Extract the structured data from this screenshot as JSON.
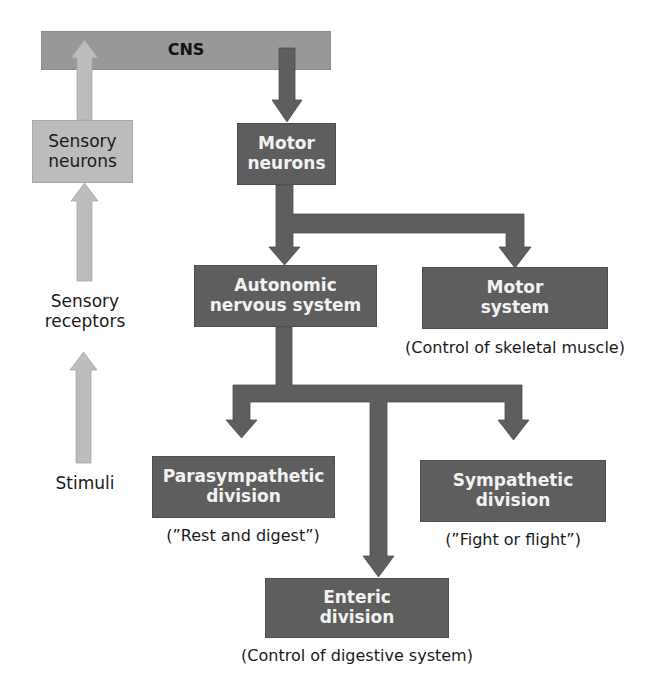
{
  "diagram": {
    "cns": {
      "label": "CNS"
    },
    "afferent": {
      "sensory_neurons": {
        "line1": "Sensory",
        "line2": "neurons"
      },
      "sensory_receptors": {
        "line1": "Sensory",
        "line2": "receptors"
      },
      "stimuli": {
        "label": "Stimuli"
      }
    },
    "efferent": {
      "motor_neurons": {
        "line1": "Motor",
        "line2": "neurons"
      },
      "autonomic": {
        "line1": "Autonomic",
        "line2": "nervous system"
      },
      "motor_system": {
        "line1": "Motor",
        "line2": "system",
        "caption": "(Control of skeletal muscle)"
      },
      "parasympathetic": {
        "line1": "Parasympathetic",
        "line2": "division",
        "caption": "(”Rest and digest”)"
      },
      "sympathetic": {
        "line1": "Sympathetic",
        "line2": "division",
        "caption": "(”Fight or flight”)"
      },
      "enteric": {
        "line1": "Enteric",
        "line2": "division",
        "caption": "(Control of digestive system)"
      }
    },
    "colors": {
      "cns_bar": "#989898",
      "efferent_box": "#5e5e5e",
      "afferent_box": "#bcbcbc",
      "efferent_arrow": "#5e5e5e",
      "afferent_arrow": "#bcbcbc"
    }
  }
}
